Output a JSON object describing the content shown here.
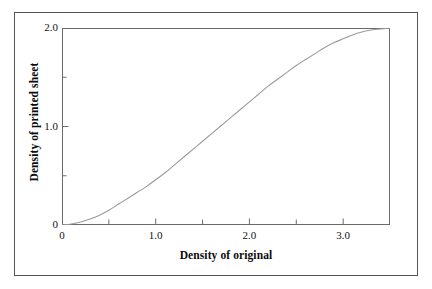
{
  "figure": {
    "background_color": "#ffffff",
    "frame_color": "#555555",
    "axis_color": "#6b6b6b",
    "curve_color": "#9a9a9a",
    "text_color": "#111111"
  },
  "chart_data": {
    "type": "line",
    "title": "",
    "subtitle": "",
    "xlabel": "Density of original",
    "ylabel": "Density of printed sheet",
    "xlim": [
      0,
      3.5
    ],
    "ylim": [
      0,
      2.0
    ],
    "grid": false,
    "legend": null,
    "legend_position": "none",
    "x_major_ticks": [
      0,
      1.0,
      2.0,
      3.0
    ],
    "x_major_tick_labels": [
      "0",
      "1.0",
      "2.0",
      "3.0"
    ],
    "x_minor_ticks": [
      0.5,
      1.5,
      2.5,
      3.5
    ],
    "y_major_ticks": [
      0,
      1.0,
      2.0
    ],
    "y_major_tick_labels": [
      "0",
      "1.0",
      "2.0"
    ],
    "y_minor_ticks": [
      0.5,
      1.5
    ],
    "series": [
      {
        "name": "tone reproduction curve",
        "color": "#9a9a9a",
        "line_width": 1.1,
        "x": [
          0.0,
          0.1,
          0.2,
          0.3,
          0.4,
          0.5,
          0.6,
          0.7,
          0.8,
          0.9,
          1.0,
          1.1,
          1.2,
          1.3,
          1.4,
          1.5,
          1.6,
          1.7,
          1.8,
          1.9,
          2.0,
          2.1,
          2.2,
          2.3,
          2.4,
          2.5,
          2.6,
          2.7,
          2.8,
          2.9,
          3.0,
          3.1,
          3.2,
          3.3,
          3.4,
          3.5
        ],
        "y": [
          0.0,
          0.01,
          0.03,
          0.06,
          0.1,
          0.15,
          0.21,
          0.27,
          0.33,
          0.39,
          0.46,
          0.53,
          0.61,
          0.69,
          0.77,
          0.85,
          0.93,
          1.01,
          1.09,
          1.17,
          1.25,
          1.33,
          1.41,
          1.48,
          1.55,
          1.62,
          1.68,
          1.74,
          1.8,
          1.85,
          1.89,
          1.93,
          1.96,
          1.98,
          1.99,
          2.0
        ]
      }
    ]
  },
  "axis_labels": {
    "x_title": "Density of original",
    "y_title": "Density of printed sheet"
  }
}
